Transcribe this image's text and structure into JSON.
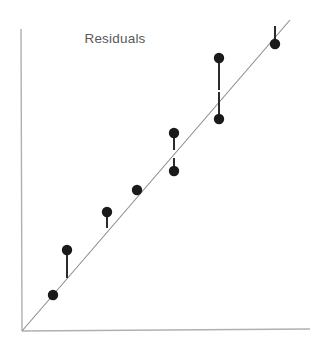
{
  "chart_data": {
    "type": "scatter",
    "title": "Residuals",
    "xlabel": "",
    "ylabel": "",
    "grid": false,
    "legend": null,
    "axis_style": {
      "x_axis": {
        "x1": 22,
        "y1": 331,
        "x2": 310,
        "y2": 329,
        "color": "#b0b0b0",
        "width": 1.4
      },
      "y_axis": {
        "x1": 21,
        "y1": 29,
        "x2": 22,
        "y2": 331,
        "color": "#b0b0b0",
        "width": 1.4
      }
    },
    "fit_line": {
      "name": "regression-line",
      "x1": 22,
      "y1": 331,
      "x2": 290,
      "y2": 20,
      "color": "#8c8c8c",
      "width": 1.1
    },
    "x": [
      53,
      67,
      107,
      137,
      174,
      174,
      219,
      219,
      275
    ],
    "y": [
      295,
      250,
      212,
      190,
      133,
      171,
      58,
      119,
      44
    ],
    "point_color": "#1a1a1a",
    "point_radius": 5.2,
    "residual_color": "#2b2b2b",
    "residual_width": 2.0,
    "points": [
      {
        "id": "p1",
        "cx": 53,
        "cy": 295,
        "residual": 0,
        "fit_y": 295,
        "on_line": true
      },
      {
        "id": "p2",
        "cx": 67,
        "cy": 250,
        "residual": 28,
        "fit_y": 278,
        "on_line": false
      },
      {
        "id": "p3",
        "cx": 107,
        "cy": 212,
        "residual": 16,
        "fit_y": 228,
        "on_line": false
      },
      {
        "id": "p4",
        "cx": 137,
        "cy": 190,
        "residual": 0,
        "fit_y": 190,
        "on_line": true
      },
      {
        "id": "p5",
        "cx": 174,
        "cy": 133,
        "residual": 17,
        "fit_y": 150,
        "on_line": false
      },
      {
        "id": "p6",
        "cx": 174,
        "cy": 171,
        "residual": -13,
        "fit_y": 158,
        "on_line": false
      },
      {
        "id": "p7",
        "cx": 219,
        "cy": 58,
        "residual": 32,
        "fit_y": 90,
        "on_line": false
      },
      {
        "id": "p8",
        "cx": 219,
        "cy": 119,
        "residual": -27,
        "fit_y": 92,
        "on_line": false
      },
      {
        "id": "p9",
        "cx": 275,
        "cy": 44,
        "residual": -18,
        "fit_y": 26,
        "on_line": false
      }
    ],
    "residual_segments": [
      {
        "id": "r2",
        "x": 67,
        "y1": 250,
        "y2": 278
      },
      {
        "id": "r3",
        "x": 107,
        "y1": 212,
        "y2": 228
      },
      {
        "id": "r5",
        "x": 174,
        "y1": 133,
        "y2": 150
      },
      {
        "id": "r6",
        "x": 174,
        "y1": 158,
        "y2": 171
      },
      {
        "id": "r7",
        "x": 219,
        "y1": 58,
        "y2": 90
      },
      {
        "id": "r8",
        "x": 219,
        "y1": 92,
        "y2": 119
      },
      {
        "id": "r9",
        "x": 275,
        "y1": 26,
        "y2": 44
      }
    ]
  },
  "figure": {
    "title": "Residuals",
    "title_x": 115,
    "title_y": 43,
    "background": "#ffffff",
    "width": 321,
    "height": 352
  }
}
